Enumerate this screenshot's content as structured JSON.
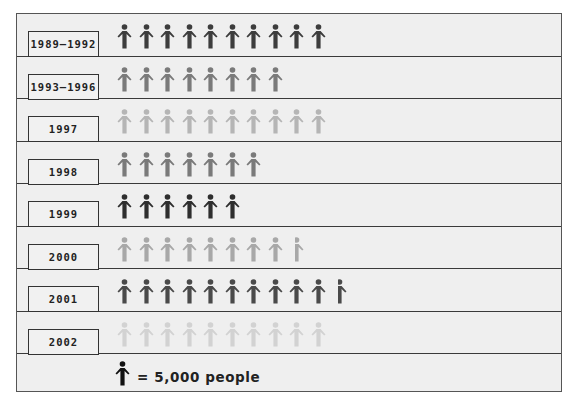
{
  "chart_data": {
    "type": "pictograph",
    "title": "",
    "unit_icon": "person-icon",
    "unit_value": 5000,
    "legend_label": "= 5,000 people",
    "categories": [
      "1989–1992",
      "1993–1996",
      "1997",
      "1998",
      "1999",
      "2000",
      "2001",
      "2002"
    ],
    "icon_counts": [
      10,
      8,
      10,
      7,
      6,
      8.5,
      10.5,
      10
    ],
    "values": [
      50000,
      40000,
      50000,
      35000,
      30000,
      42500,
      52500,
      50000
    ],
    "row_colors": [
      "#3d3d3d",
      "#7a7a7a",
      "#b5b5b5",
      "#7a7a7a",
      "#2e2e2e",
      "#a8a8a8",
      "#4a4a4a",
      "#d2d2d2"
    ]
  },
  "rows": [
    {
      "label": "1989–1992",
      "count": 10,
      "color": "#3d3d3d"
    },
    {
      "label": "1993–1996",
      "count": 8,
      "color": "#7a7a7a"
    },
    {
      "label": "1997",
      "count": 10,
      "color": "#b5b5b5"
    },
    {
      "label": "1998",
      "count": 7,
      "color": "#7a7a7a"
    },
    {
      "label": "1999",
      "count": 6,
      "color": "#2e2e2e"
    },
    {
      "label": "2000",
      "count": 8.5,
      "color": "#a8a8a8"
    },
    {
      "label": "2001",
      "count": 10.5,
      "color": "#4a4a4a"
    },
    {
      "label": "2002",
      "count": 10,
      "color": "#d2d2d2"
    }
  ],
  "legend": {
    "icon": "person-icon",
    "icon_color": "#111111",
    "text": "= 5,000 people"
  }
}
